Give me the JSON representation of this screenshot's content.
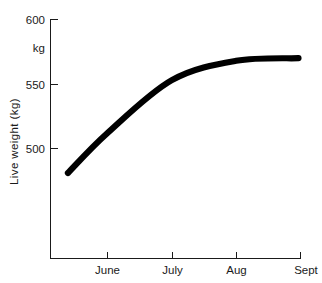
{
  "chart_data": {
    "type": "line",
    "title": "",
    "xlabel": "",
    "ylabel": "Live weight (kg)",
    "y_unit_label": "kg",
    "ylim": [
      470,
      600
    ],
    "y_ticks": [
      500,
      550,
      600
    ],
    "y_tick_labels": [
      "500",
      "550",
      "600"
    ],
    "grid": false,
    "legend": false,
    "categories": [
      "June",
      "July",
      "Aug",
      "Sept"
    ],
    "x_tick_labels": [
      "June",
      "July",
      "Aug",
      "Sept"
    ],
    "series": [
      {
        "name": "Live weight",
        "color": "#000000",
        "x": [
          "mid-May",
          "June",
          "July",
          "Aug",
          "Sept"
        ],
        "points": [
          {
            "x_label": "mid-May",
            "value": 481
          },
          {
            "x_label": "June",
            "value": 512
          },
          {
            "x_label": "July",
            "value": 553
          },
          {
            "x_label": "Aug",
            "value": 568
          },
          {
            "x_label": "Sept",
            "value": 570
          }
        ],
        "values": [
          481,
          512,
          553,
          568,
          570
        ]
      }
    ]
  },
  "axes": {
    "y_axis": {
      "title": "Live weight (kg)",
      "unit": "kg",
      "ticks": [
        {
          "label": "600",
          "value": 600
        },
        {
          "label": "550",
          "value": 550
        },
        {
          "label": "500",
          "value": 500
        }
      ]
    },
    "x_axis": {
      "ticks": [
        {
          "label": "June"
        },
        {
          "label": "July"
        },
        {
          "label": "Aug"
        },
        {
          "label": "Sept"
        }
      ]
    }
  },
  "colors": {
    "line": "#000000",
    "axis": "#1a1a1a",
    "background": "#ffffff"
  }
}
